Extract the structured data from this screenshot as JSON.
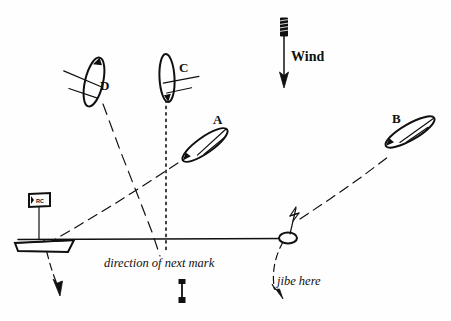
{
  "figure": {
    "background_color": "#ffffff",
    "ink_color": "#101010"
  },
  "wind": {
    "label": "Wind",
    "direction": "down",
    "arrow_icon": "wind-arrow-icon",
    "arrow_top_y": 18,
    "arrow_bottom_y": 88,
    "arrow_x": 284
  },
  "boats": [
    {
      "id": "A",
      "label": "A",
      "label_x": 216,
      "label_y": 122,
      "hull_cx": 205,
      "hull_cy": 145,
      "rotation": -35,
      "note": "beating up on port toward mark"
    },
    {
      "id": "B",
      "label": "B",
      "label_x": 396,
      "label_y": 121,
      "hull_cx": 410,
      "hull_cy": 132,
      "rotation": -30,
      "note": "reaching away after jibe"
    },
    {
      "id": "C",
      "label": "C",
      "label_x": 181,
      "label_y": 70,
      "hull_cx": 168,
      "hull_cy": 78,
      "rotation": -4,
      "note": "running straight downwind"
    },
    {
      "id": "D",
      "label": "D",
      "label_x": 103,
      "label_y": 88,
      "hull_cx": 93,
      "hull_cy": 82,
      "rotation": 10,
      "note": "running on the opposite gybe"
    }
  ],
  "committee_boat": {
    "name": "committee-boat",
    "flag_label": "RC",
    "hull_x": 14,
    "hull_y": 236
  },
  "mark_buoy": {
    "name": "mark-buoy",
    "x": 286,
    "y": 237,
    "has_flag": true
  },
  "start_line": {
    "name": "start-line",
    "x1": 18,
    "y1": 239,
    "x2": 288,
    "y2": 238
  },
  "annotations": [
    {
      "id": "direction-of-next-mark",
      "text": "direction of next mark",
      "x": 104,
      "y": 267,
      "style": "italic"
    },
    {
      "id": "jibe-here",
      "text": "jibe here",
      "x": 276,
      "y": 284,
      "style": "italic"
    }
  ],
  "tracks": [
    {
      "id": "track-A",
      "style": "dashed",
      "description": "from below start line up to boat A"
    },
    {
      "id": "track-B",
      "style": "dashed",
      "description": "from mark buoy up-right to boat B"
    },
    {
      "id": "track-C",
      "style": "dotted",
      "description": "vertical line from boat C down through start line"
    },
    {
      "id": "track-D",
      "style": "dashed",
      "description": "long line from boat D down across to lower left"
    },
    {
      "id": "track-left-exit",
      "style": "dashed",
      "description": "curve from committee boat end down to arrow"
    },
    {
      "id": "track-jibe-exit",
      "style": "dashed",
      "description": "curve from mark buoy down to arrow"
    }
  ],
  "next_mark_marker": {
    "name": "next-mark-direction-marker",
    "x": 182,
    "y_top": 280,
    "y_bottom": 302
  }
}
